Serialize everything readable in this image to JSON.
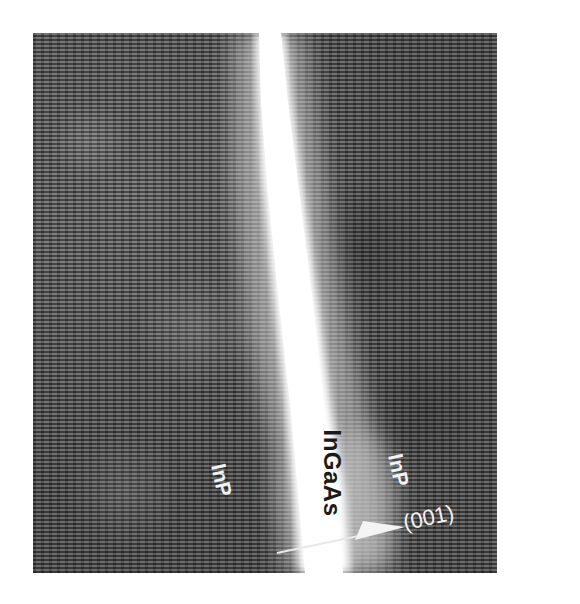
{
  "figure": {
    "type": "HRTEM lattice image",
    "colors": {
      "background": "#ffffff",
      "lattice_mid": "#5a5a5a",
      "interface_layer": "#ffffff",
      "light_label": "#f2f2f2",
      "dark_label": "#1a1a1a"
    },
    "labels": {
      "left_layer": "InP",
      "center_layer": "InGaAs",
      "right_layer": "InP",
      "direction": "(001)"
    },
    "direction_arrow": "growth-direction-arrow"
  }
}
